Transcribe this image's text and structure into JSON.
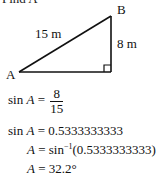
{
  "header": {
    "clipped_text": "Find A"
  },
  "diagram": {
    "vertices": {
      "A": "A",
      "B": "B"
    },
    "hypotenuse_label": "15 m",
    "opposite_label": "8 m",
    "right_angle": true
  },
  "solution": {
    "line1": {
      "lhs": "sin",
      "var": "A",
      "eq": " = ",
      "num": "8",
      "den": "15"
    },
    "line2": {
      "lhs": "sin",
      "var": "A",
      "rhs": " = 0.5333333333"
    },
    "line3": {
      "var": "A",
      "rhs_fn": " = sin",
      "sup": "−1",
      "rhs_arg": "(0.5333333333)"
    },
    "line4": {
      "var": "A",
      "rhs": " = 32.2°"
    }
  }
}
